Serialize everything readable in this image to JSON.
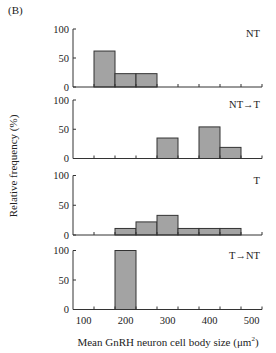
{
  "figure": {
    "panel_label": "(B)",
    "ylabel": "Relative frequency (%)",
    "xlabel_main": "Mean GnRH neuron cell body size (μm",
    "xlabel_sup": "2",
    "xlabel_close": ")"
  },
  "style": {
    "bar_fill": "#a3a3a3",
    "bar_stroke": "#333333",
    "axis_color": "#333333"
  },
  "chart_data": {
    "type": "bar",
    "subtype": "stacked-panel histograms",
    "title": "",
    "panel_label": "(B)",
    "xlabel": "Mean GnRH neuron cell body size (μm²)",
    "ylabel": "Relative frequency (%)",
    "xlim": [
      75,
      525
    ],
    "ylim": [
      0,
      100
    ],
    "x_ticks": [
      100,
      200,
      300,
      400,
      500
    ],
    "y_ticks": [
      0,
      50,
      100
    ],
    "bin_edges": [
      125,
      175,
      225,
      275,
      325,
      375,
      425,
      475,
      525
    ],
    "bin_width": 50,
    "grid": false,
    "legend": "none (panel labels top-right)",
    "panels": [
      {
        "name": "NT",
        "bars": [
          {
            "from": 125,
            "to": 175,
            "value": 62
          },
          {
            "from": 175,
            "to": 225,
            "value": 23
          },
          {
            "from": 225,
            "to": 275,
            "value": 23
          }
        ]
      },
      {
        "name": "NT→T",
        "bars": [
          {
            "from": 275,
            "to": 325,
            "value": 35
          },
          {
            "from": 375,
            "to": 425,
            "value": 54
          },
          {
            "from": 425,
            "to": 475,
            "value": 19
          }
        ]
      },
      {
        "name": "T",
        "bars": [
          {
            "from": 175,
            "to": 225,
            "value": 11
          },
          {
            "from": 225,
            "to": 275,
            "value": 22
          },
          {
            "from": 275,
            "to": 325,
            "value": 33
          },
          {
            "from": 325,
            "to": 375,
            "value": 11
          },
          {
            "from": 375,
            "to": 425,
            "value": 11
          },
          {
            "from": 425,
            "to": 475,
            "value": 11
          }
        ]
      },
      {
        "name": "T→NT",
        "bars": [
          {
            "from": 175,
            "to": 225,
            "value": 100
          }
        ]
      }
    ]
  }
}
